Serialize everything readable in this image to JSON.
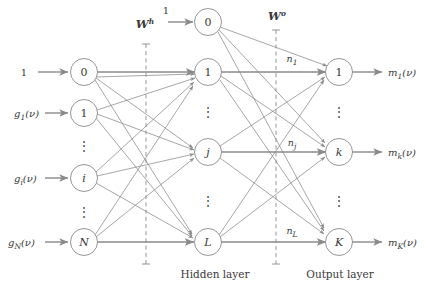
{
  "figure": {
    "type": "neural-network-diagram",
    "background_color": "#ffffff",
    "stroke_color": "#8a8a8a",
    "text_color": "#3a3a3a"
  },
  "weights": {
    "hidden": {
      "base": "W",
      "superscript": "h",
      "full": "W^h"
    },
    "output": {
      "base": "W",
      "superscript": "o",
      "full": "W^o"
    }
  },
  "captions": {
    "hidden_layer": "Hidden layer",
    "output_layer": "Output layer"
  },
  "input_layer": {
    "bias_signal": "1",
    "nodes": [
      {
        "id": "in-bias",
        "label": "0",
        "italic": false,
        "input_label": "1",
        "input_label_italic": false
      },
      {
        "id": "in-1",
        "label": "1",
        "italic": false,
        "input_label": "g_1(v)",
        "input_base": "g",
        "input_sub": "1",
        "input_arg": "(ν)"
      },
      {
        "id": "in-i",
        "label": "i",
        "italic": true,
        "input_label": "g_i(v)",
        "input_base": "g",
        "input_sub": "i",
        "input_arg": "(ν)"
      },
      {
        "id": "in-N",
        "label": "N",
        "italic": true,
        "input_label": "g_N(v)",
        "input_base": "g",
        "input_sub": "N",
        "input_arg": "(ν)"
      }
    ],
    "ellipses": 2
  },
  "hidden_layer": {
    "bias_signal": "1",
    "nodes": [
      {
        "id": "hid-bias",
        "label": "0",
        "italic": false
      },
      {
        "id": "hid-1",
        "label": "1",
        "italic": false
      },
      {
        "id": "hid-j",
        "label": "j",
        "italic": true
      },
      {
        "id": "hid-L",
        "label": "L",
        "italic": true
      }
    ],
    "ellipses": 2
  },
  "output_layer": {
    "nodes": [
      {
        "id": "out-1",
        "label": "1",
        "italic": false,
        "output_base": "m",
        "output_sub": "1",
        "output_arg": "(ν)",
        "output_label": "m_1(v)"
      },
      {
        "id": "out-k",
        "label": "k",
        "italic": true,
        "output_base": "m",
        "output_sub": "k",
        "output_arg": "(ν)",
        "output_label": "m_k(v)"
      },
      {
        "id": "out-K",
        "label": "K",
        "italic": true,
        "output_base": "m",
        "output_sub": "K",
        "output_arg": "(ν)",
        "output_label": "m_K(v)"
      }
    ],
    "ellipses": 2
  },
  "edge_labels": [
    {
      "id": "n-1",
      "base": "n",
      "sub": "1",
      "full": "n_1"
    },
    {
      "id": "n-j",
      "base": "n",
      "sub": "j",
      "full": "n_j"
    },
    {
      "id": "n-L",
      "base": "n",
      "sub": "L",
      "full": "n_L"
    }
  ],
  "ellipsis_glyph": "⋮"
}
